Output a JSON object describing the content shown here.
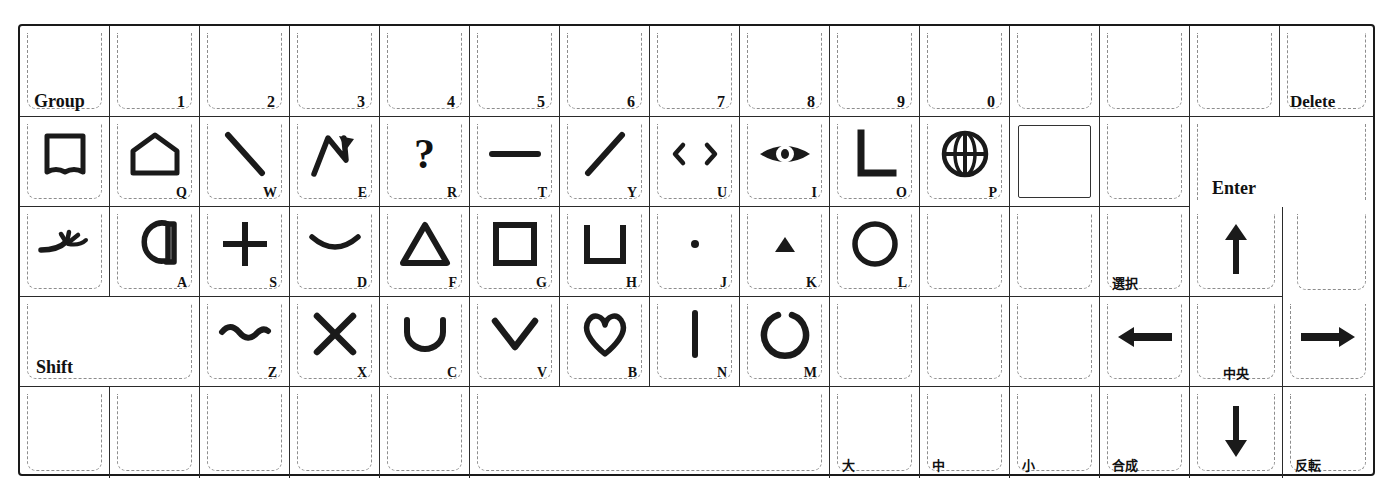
{
  "device": {
    "type": "keyboard-overlay-template",
    "title": "Graphics tablet / CAD keyboard overlay sheet",
    "columns": 15,
    "rows": 5
  },
  "colors": {
    "ink": "#1a1a1a",
    "key_outline": "#8d8d8d",
    "sheet": "#ffffff"
  },
  "rows": [
    {
      "name": "number-row",
      "keys": [
        {
          "id": "group",
          "label": "Group",
          "legend_pos": "bottom-left",
          "glyph": "none"
        },
        {
          "id": "num-1",
          "label": "1",
          "legend_pos": "bottom-right",
          "glyph": "none"
        },
        {
          "id": "num-2",
          "label": "2",
          "legend_pos": "bottom-right",
          "glyph": "none"
        },
        {
          "id": "num-3",
          "label": "3",
          "legend_pos": "bottom-right",
          "glyph": "none"
        },
        {
          "id": "num-4",
          "label": "4",
          "legend_pos": "bottom-right",
          "glyph": "none"
        },
        {
          "id": "num-5",
          "label": "5",
          "legend_pos": "bottom-right",
          "glyph": "none"
        },
        {
          "id": "num-6",
          "label": "6",
          "legend_pos": "bottom-right",
          "glyph": "none"
        },
        {
          "id": "num-7",
          "label": "7",
          "legend_pos": "bottom-right",
          "glyph": "none"
        },
        {
          "id": "num-8",
          "label": "8",
          "legend_pos": "bottom-right",
          "glyph": "none"
        },
        {
          "id": "num-9",
          "label": "9",
          "legend_pos": "bottom-right",
          "glyph": "none"
        },
        {
          "id": "num-0",
          "label": "0",
          "legend_pos": "bottom-right",
          "glyph": "none"
        },
        {
          "id": "blank-r1-a",
          "label": "",
          "legend_pos": "none",
          "glyph": "none"
        },
        {
          "id": "blank-r1-b",
          "label": "",
          "legend_pos": "none",
          "glyph": "none"
        },
        {
          "id": "blank-r1-c",
          "label": "",
          "legend_pos": "none",
          "glyph": "none"
        },
        {
          "id": "delete",
          "label": "Delete",
          "legend_pos": "bottom-left",
          "glyph": "none"
        }
      ]
    },
    {
      "name": "q-row",
      "keys": [
        {
          "id": "book",
          "label": "",
          "legend_pos": "none",
          "glyph": "open-book"
        },
        {
          "id": "key-q",
          "label": "Q",
          "legend_pos": "bottom-right",
          "glyph": "pentagon-house"
        },
        {
          "id": "key-w",
          "label": "W",
          "legend_pos": "bottom-right",
          "glyph": "backslash-line"
        },
        {
          "id": "key-e",
          "label": "E",
          "legend_pos": "bottom-right",
          "glyph": "polyline-arrow"
        },
        {
          "id": "key-r",
          "label": "R",
          "legend_pos": "bottom-right",
          "glyph": "question-mark"
        },
        {
          "id": "key-t",
          "label": "T",
          "legend_pos": "bottom-right",
          "glyph": "horizontal-line"
        },
        {
          "id": "key-y",
          "label": "Y",
          "legend_pos": "bottom-right",
          "glyph": "slash-line"
        },
        {
          "id": "key-u",
          "label": "U",
          "legend_pos": "bottom-right",
          "glyph": "left-right-chevrons"
        },
        {
          "id": "key-i",
          "label": "I",
          "legend_pos": "bottom-right",
          "glyph": "eye"
        },
        {
          "id": "key-o",
          "label": "O",
          "legend_pos": "bottom-right",
          "glyph": "right-angle-L"
        },
        {
          "id": "key-p",
          "label": "P",
          "legend_pos": "bottom-right",
          "glyph": "globe-grid"
        },
        {
          "id": "filled-square",
          "label": "",
          "legend_pos": "none",
          "glyph": "square-outline-large"
        },
        {
          "id": "blank-r2-a",
          "label": "",
          "legend_pos": "none",
          "glyph": "none"
        },
        {
          "id": "enter",
          "label": "Enter",
          "legend_pos": "bottom-left",
          "glyph": "none",
          "shape": "reverse-L"
        }
      ]
    },
    {
      "name": "a-row",
      "keys": [
        {
          "id": "sprout",
          "label": "",
          "legend_pos": "none",
          "glyph": "sprout-branch"
        },
        {
          "id": "key-a",
          "label": "A",
          "legend_pos": "bottom-right",
          "glyph": "circle-tail"
        },
        {
          "id": "key-s",
          "label": "S",
          "legend_pos": "bottom-right",
          "glyph": "plus-cross"
        },
        {
          "id": "key-d",
          "label": "D",
          "legend_pos": "bottom-right",
          "glyph": "arc-down"
        },
        {
          "id": "key-f",
          "label": "F",
          "legend_pos": "bottom-right",
          "glyph": "triangle-outline"
        },
        {
          "id": "key-g",
          "label": "G",
          "legend_pos": "bottom-right",
          "glyph": "square-outline"
        },
        {
          "id": "key-h",
          "label": "H",
          "legend_pos": "bottom-right",
          "glyph": "u-bracket"
        },
        {
          "id": "key-j",
          "label": "J",
          "legend_pos": "bottom-right",
          "glyph": "dot-point"
        },
        {
          "id": "key-k",
          "label": "K",
          "legend_pos": "bottom-right",
          "glyph": "small-triangle-up"
        },
        {
          "id": "key-l",
          "label": "L",
          "legend_pos": "bottom-right",
          "glyph": "circle-outline"
        },
        {
          "id": "blank-r3-a",
          "label": "",
          "legend_pos": "none",
          "glyph": "none"
        },
        {
          "id": "blank-r3-b",
          "label": "",
          "legend_pos": "none",
          "glyph": "none"
        },
        {
          "id": "select",
          "label": "選択",
          "legend_pos": "bottom-left-jp",
          "glyph": "none"
        },
        {
          "id": "arrow-up",
          "label": "",
          "legend_pos": "none",
          "glyph": "arrow-up"
        }
      ]
    },
    {
      "name": "shift-row",
      "keys": [
        {
          "id": "shift",
          "label": "Shift",
          "legend_pos": "bottom-left",
          "glyph": "none",
          "span": 2
        },
        {
          "id": "key-z",
          "label": "Z",
          "legend_pos": "bottom-right",
          "glyph": "tilde-wave"
        },
        {
          "id": "key-x",
          "label": "X",
          "legend_pos": "bottom-right",
          "glyph": "x-cross"
        },
        {
          "id": "key-c",
          "label": "C",
          "legend_pos": "bottom-right",
          "glyph": "u-arc"
        },
        {
          "id": "key-v",
          "label": "V",
          "legend_pos": "bottom-right",
          "glyph": "v-chevron"
        },
        {
          "id": "key-b",
          "label": "B",
          "legend_pos": "bottom-right",
          "glyph": "heart"
        },
        {
          "id": "key-n",
          "label": "N",
          "legend_pos": "bottom-right",
          "glyph": "vertical-line"
        },
        {
          "id": "key-m",
          "label": "M",
          "legend_pos": "bottom-right",
          "glyph": "open-circle-gap"
        },
        {
          "id": "blank-r4-a",
          "label": "",
          "legend_pos": "none",
          "glyph": "none"
        },
        {
          "id": "blank-r4-b",
          "label": "",
          "legend_pos": "none",
          "glyph": "none"
        },
        {
          "id": "blank-r4-c",
          "label": "",
          "legend_pos": "none",
          "glyph": "none"
        },
        {
          "id": "arrow-left",
          "label": "",
          "legend_pos": "none",
          "glyph": "arrow-left"
        },
        {
          "id": "center",
          "label": "中央",
          "legend_pos": "bottom-center-jp",
          "glyph": "none"
        },
        {
          "id": "arrow-right",
          "label": "",
          "legend_pos": "none",
          "glyph": "arrow-right"
        }
      ]
    },
    {
      "name": "space-row",
      "keys": [
        {
          "id": "blank-r5-a",
          "label": "",
          "legend_pos": "none",
          "glyph": "none"
        },
        {
          "id": "blank-r5-b",
          "label": "",
          "legend_pos": "none",
          "glyph": "none"
        },
        {
          "id": "blank-r5-c",
          "label": "",
          "legend_pos": "none",
          "glyph": "none"
        },
        {
          "id": "blank-r5-d",
          "label": "",
          "legend_pos": "none",
          "glyph": "none"
        },
        {
          "id": "spacebar",
          "label": "",
          "legend_pos": "none",
          "glyph": "none",
          "span": 5
        },
        {
          "id": "size-large",
          "label": "大",
          "legend_pos": "bottom-left-jp",
          "glyph": "none"
        },
        {
          "id": "size-medium",
          "label": "中",
          "legend_pos": "bottom-left-jp",
          "glyph": "none"
        },
        {
          "id": "size-small",
          "label": "小",
          "legend_pos": "bottom-left-jp",
          "glyph": "none"
        },
        {
          "id": "composite",
          "label": "合成",
          "legend_pos": "bottom-left-jp",
          "glyph": "none"
        },
        {
          "id": "arrow-down",
          "label": "",
          "legend_pos": "none",
          "glyph": "arrow-down"
        },
        {
          "id": "invert",
          "label": "反転",
          "legend_pos": "bottom-left-jp",
          "glyph": "none"
        }
      ]
    }
  ],
  "legend_text": {
    "group": "Group",
    "delete": "Delete",
    "enter": "Enter",
    "shift": "Shift",
    "select": "選択",
    "center": "中央",
    "composite": "合成",
    "invert": "反転",
    "size_large": "大",
    "size_medium": "中",
    "size_small": "小",
    "n1": "1",
    "n2": "2",
    "n3": "3",
    "n4": "4",
    "n5": "5",
    "n6": "6",
    "n7": "7",
    "n8": "8",
    "n9": "9",
    "n0": "0",
    "q": "Q",
    "w": "W",
    "e": "E",
    "r": "R",
    "t": "T",
    "y": "Y",
    "u": "U",
    "i": "I",
    "o": "O",
    "p": "P",
    "a": "A",
    "s": "S",
    "d": "D",
    "f": "F",
    "g": "G",
    "h": "H",
    "j": "J",
    "k": "K",
    "l": "L",
    "z": "Z",
    "x": "X",
    "c": "C",
    "v": "V",
    "b": "B",
    "n": "N",
    "m": "M"
  }
}
